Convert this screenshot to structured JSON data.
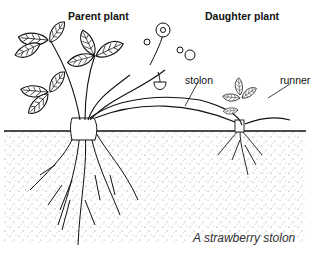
{
  "diagram": {
    "caption": "A strawberry stolon",
    "labels": {
      "parent": "Parent plant",
      "daughter": "Daughter plant",
      "stolon": "stolon",
      "runner": "runner"
    },
    "colors": {
      "ink": "#111111",
      "soil_dots": "#555555",
      "background": "#ffffff"
    }
  }
}
